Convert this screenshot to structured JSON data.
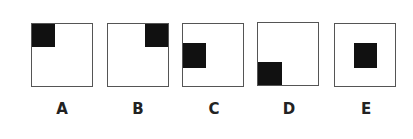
{
  "figure": {
    "options": [
      {
        "label": "A",
        "position": "top-left"
      },
      {
        "label": "B",
        "position": "top-right"
      },
      {
        "label": "C",
        "position": "middle-left"
      },
      {
        "label": "D",
        "position": "bottom-left"
      },
      {
        "label": "E",
        "position": "center"
      }
    ],
    "colors": {
      "border": "#555555",
      "fill": "#111111",
      "background": "#ffffff"
    }
  }
}
